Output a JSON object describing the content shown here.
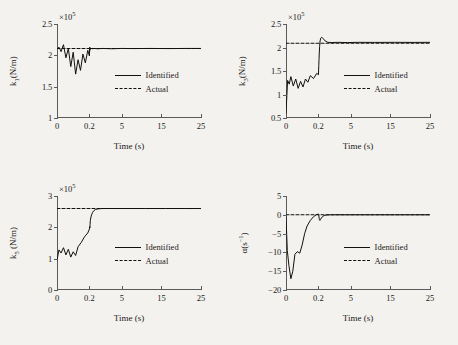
{
  "figure": {
    "background_color": "#f4f2ee",
    "line_color": "#111111",
    "axis_color": "#5a5a5a"
  },
  "legend": {
    "identified": "Identified",
    "actual": "Actual"
  },
  "panels": [
    {
      "id": "k1",
      "ytitle_main": "k",
      "ytitle_sub": "1",
      "ytitle_rest": "(N/m)",
      "xtitle": "Time (s)",
      "multiplier": "×10",
      "multiplier_exp": "5"
    },
    {
      "id": "k3",
      "ytitle_main": "k",
      "ytitle_sub": "3",
      "ytitle_rest": "(N/m)",
      "xtitle": "Time (s)",
      "multiplier": "×10",
      "multiplier_exp": "5"
    },
    {
      "id": "k5",
      "ytitle_main": "k",
      "ytitle_sub": "5",
      "ytitle_rest": " (N/m)",
      "xtitle": "Time (s)",
      "multiplier": "×10",
      "multiplier_exp": "5"
    },
    {
      "id": "alpha",
      "ytitle_main": "α(s",
      "ytitle_sub": "",
      "ytitle_rest": ")",
      "ytitle_sup": "−1",
      "xtitle": "Time (s)",
      "multiplier": "",
      "multiplier_exp": ""
    }
  ],
  "chart_data": [
    {
      "type": "line",
      "id": "k1",
      "title": "",
      "xlabel": "Time (s)",
      "ylabel": "k1(N/m)",
      "y_multiplier": 100000,
      "y_multiplier_label": "×10^5",
      "xlim": [
        0,
        25
      ],
      "ylim": [
        1,
        2.5
      ],
      "xticks": [
        0,
        0.2,
        5,
        15,
        25
      ],
      "xtick_labels": [
        "0",
        "0.2",
        "5",
        "15",
        "25"
      ],
      "xtick_positions_frac": [
        0.0,
        0.225,
        0.45,
        0.725,
        1.0
      ],
      "yticks": [
        1,
        1.5,
        2,
        2.5
      ],
      "ytick_labels": [
        "1",
        "1.5",
        "2",
        "2.5"
      ],
      "grid": false,
      "legend_position": "center-right",
      "series": [
        {
          "name": "Identified",
          "style": "solid",
          "x": [
            0,
            0.012,
            0.025,
            0.04,
            0.055,
            0.07,
            0.085,
            0.1,
            0.115,
            0.13,
            0.145,
            0.16,
            0.175,
            0.19,
            0.205,
            0.22,
            0.24,
            0.26,
            0.28,
            0.32,
            0.38,
            0.45,
            0.6,
            0.9,
            1.4,
            2.2,
            3.5,
            5,
            8,
            12,
            17,
            21,
            25
          ],
          "y": [
            2.1,
            2.13,
            2.06,
            2.17,
            1.96,
            2.11,
            1.82,
            2.05,
            1.7,
            1.93,
            1.76,
            2.02,
            1.88,
            2.08,
            1.99,
            2.12,
            2.06,
            2.13,
            2.09,
            2.115,
            2.1,
            2.112,
            2.105,
            2.11,
            2.105,
            2.11,
            2.105,
            2.11,
            2.108,
            2.11,
            2.108,
            2.11,
            2.11
          ]
        },
        {
          "name": "Actual",
          "style": "dashed",
          "x": [
            0,
            25
          ],
          "y": [
            2.11,
            2.11
          ]
        }
      ]
    },
    {
      "type": "line",
      "id": "k3",
      "title": "",
      "xlabel": "Time (s)",
      "ylabel": "k3(N/m)",
      "y_multiplier": 100000,
      "y_multiplier_label": "×10^5",
      "xlim": [
        0,
        25
      ],
      "ylim": [
        0.5,
        2.5
      ],
      "xticks": [
        0,
        0.2,
        5,
        15,
        25
      ],
      "xtick_labels": [
        "0",
        "0.2",
        "5",
        "15",
        "25"
      ],
      "xtick_positions_frac": [
        0.0,
        0.225,
        0.45,
        0.725,
        1.0
      ],
      "yticks": [
        0.5,
        1,
        1.5,
        2,
        2.5
      ],
      "ytick_labels": [
        "0.5",
        "1",
        "1.5",
        "2",
        "2.5"
      ],
      "grid": false,
      "legend_position": "center-right",
      "series": [
        {
          "name": "Identified",
          "style": "solid",
          "x": [
            0,
            0.01,
            0.02,
            0.03,
            0.045,
            0.06,
            0.075,
            0.09,
            0.105,
            0.12,
            0.135,
            0.15,
            0.17,
            0.19,
            0.21,
            0.23,
            0.26,
            0.29,
            0.33,
            0.38,
            0.45,
            0.55,
            0.7,
            0.9,
            1.2,
            1.6,
            2.2,
            3,
            4.5,
            7,
            11,
            16,
            21,
            25
          ],
          "y": [
            0.6,
            1.3,
            1.22,
            1.38,
            1.18,
            1.33,
            1.13,
            1.28,
            1.16,
            1.33,
            1.26,
            1.4,
            1.34,
            1.45,
            1.42,
            1.52,
            1.62,
            1.74,
            1.88,
            2.02,
            2.14,
            2.2,
            2.22,
            2.19,
            2.14,
            2.11,
            2.105,
            2.11,
            2.105,
            2.11,
            2.108,
            2.11,
            2.108,
            2.11
          ]
        },
        {
          "name": "Actual",
          "style": "dashed",
          "x": [
            0,
            25
          ],
          "y": [
            2.09,
            2.09
          ]
        }
      ]
    },
    {
      "type": "line",
      "id": "k5",
      "title": "",
      "xlabel": "Time (s)",
      "ylabel": "k5 (N/m)",
      "y_multiplier": 100000,
      "y_multiplier_label": "×10^5",
      "xlim": [
        0,
        25
      ],
      "ylim": [
        0,
        3
      ],
      "xticks": [
        0,
        0.2,
        5,
        15,
        25
      ],
      "xtick_labels": [
        "0",
        "0.2",
        "5",
        "15",
        "25"
      ],
      "xtick_positions_frac": [
        0.0,
        0.225,
        0.45,
        0.725,
        1.0
      ],
      "yticks": [
        0,
        1,
        2,
        3
      ],
      "ytick_labels": [
        "0",
        "1",
        "2",
        "3"
      ],
      "grid": false,
      "legend_position": "center-right",
      "series": [
        {
          "name": "Identified",
          "style": "solid",
          "x": [
            0,
            0.012,
            0.025,
            0.04,
            0.055,
            0.07,
            0.085,
            0.1,
            0.115,
            0.13,
            0.15,
            0.17,
            0.19,
            0.21,
            0.24,
            0.27,
            0.3,
            0.34,
            0.4,
            0.47,
            0.56,
            0.68,
            0.85,
            1.1,
            1.5,
            2.1,
            3,
            4.5,
            7,
            11,
            16,
            21,
            25
          ],
          "y": [
            0.95,
            1.28,
            1.18,
            1.35,
            1.12,
            1.3,
            1.05,
            1.22,
            1.1,
            1.38,
            1.52,
            1.7,
            1.82,
            1.95,
            2.02,
            1.98,
            2.1,
            2.22,
            2.3,
            2.36,
            2.42,
            2.48,
            2.53,
            2.57,
            2.59,
            2.6,
            2.6,
            2.6,
            2.6,
            2.6,
            2.6,
            2.6,
            2.6
          ]
        },
        {
          "name": "Actual",
          "style": "dashed",
          "x": [
            0,
            25
          ],
          "y": [
            2.6,
            2.6
          ]
        }
      ]
    },
    {
      "type": "line",
      "id": "alpha",
      "title": "",
      "xlabel": "Time (s)",
      "ylabel": "α(s^-1)",
      "y_multiplier": 1,
      "y_multiplier_label": "",
      "xlim": [
        0,
        25
      ],
      "ylim": [
        -20,
        5
      ],
      "xticks": [
        0,
        0.2,
        5,
        15,
        25
      ],
      "xtick_labels": [
        "0",
        "0.2",
        "5",
        "15",
        "25"
      ],
      "xtick_positions_frac": [
        0.0,
        0.225,
        0.45,
        0.725,
        1.0
      ],
      "yticks": [
        -20,
        -15,
        -10,
        -5,
        0,
        5
      ],
      "ytick_labels": [
        "−20",
        "−15",
        "−10",
        "−5",
        "0",
        "5"
      ],
      "grid": false,
      "legend_position": "center-right",
      "series": [
        {
          "name": "Identified",
          "style": "solid",
          "x": [
            0,
            0.008,
            0.018,
            0.03,
            0.042,
            0.055,
            0.07,
            0.085,
            0.1,
            0.115,
            0.13,
            0.15,
            0.17,
            0.19,
            0.21,
            0.24,
            0.27,
            0.31,
            0.36,
            0.42,
            0.5,
            0.62,
            0.8,
            1.05,
            1.4,
            2,
            3,
            4.5,
            7,
            11,
            16,
            21,
            25
          ],
          "y": [
            -0.5,
            -9.5,
            -13.5,
            -17.0,
            -15.0,
            -10.5,
            -9.8,
            -10.2,
            -8.0,
            -5.0,
            -3.0,
            -1.5,
            -0.5,
            0.1,
            0.2,
            0.1,
            -0.3,
            -0.9,
            -1.3,
            -1.5,
            -1.3,
            -0.9,
            -0.5,
            -0.2,
            -0.05,
            0.0,
            0.0,
            0.0,
            0.0,
            0.0,
            0.0,
            0.0,
            0.0
          ]
        },
        {
          "name": "Actual",
          "style": "dashed",
          "x": [
            0,
            25
          ],
          "y": [
            0.0,
            0.0
          ]
        }
      ]
    }
  ]
}
